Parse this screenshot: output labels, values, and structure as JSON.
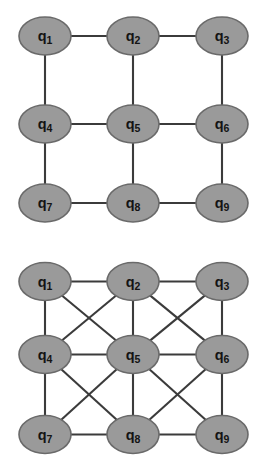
{
  "figure": {
    "background_color": "#ffffff",
    "node_fill_color": "#9a9a9a",
    "node_border_color": "#6a6a6a",
    "edge_color": "#3b3b3b",
    "label_color": "#141414"
  },
  "graphs": [
    {
      "id": "graph-top",
      "name": "nearest-neighbour-lattice",
      "description": "3x3 qubit grid with nearest-neighbour (orthogonal) couplings only",
      "rows": 3,
      "columns": 3,
      "nodes": [
        {
          "id": "q1",
          "symbol": "q",
          "subscript": "1",
          "label": "q1",
          "row": 0,
          "col": 0,
          "cx": 45,
          "cy": 36
        },
        {
          "id": "q2",
          "symbol": "q",
          "subscript": "2",
          "label": "q2",
          "row": 0,
          "col": 1,
          "cx": 133,
          "cy": 36
        },
        {
          "id": "q3",
          "symbol": "q",
          "subscript": "3",
          "label": "q3",
          "row": 0,
          "col": 2,
          "cx": 222,
          "cy": 36
        },
        {
          "id": "q4",
          "symbol": "q",
          "subscript": "4",
          "label": "q4",
          "row": 1,
          "col": 0,
          "cx": 45,
          "cy": 124
        },
        {
          "id": "q5",
          "symbol": "q",
          "subscript": "5",
          "label": "q5",
          "row": 1,
          "col": 1,
          "cx": 133,
          "cy": 124
        },
        {
          "id": "q6",
          "symbol": "q",
          "subscript": "6",
          "label": "q6",
          "row": 1,
          "col": 2,
          "cx": 222,
          "cy": 124
        },
        {
          "id": "q7",
          "symbol": "q",
          "subscript": "7",
          "label": "q7",
          "row": 2,
          "col": 0,
          "cx": 45,
          "cy": 203
        },
        {
          "id": "q8",
          "symbol": "q",
          "subscript": "8",
          "label": "q8",
          "row": 2,
          "col": 1,
          "cx": 133,
          "cy": 203
        },
        {
          "id": "q9",
          "symbol": "q",
          "subscript": "9",
          "label": "q9",
          "row": 2,
          "col": 2,
          "cx": 222,
          "cy": 203
        }
      ],
      "edges": [
        {
          "from": "q1",
          "to": "q2",
          "kind": "horizontal"
        },
        {
          "from": "q2",
          "to": "q3",
          "kind": "horizontal"
        },
        {
          "from": "q4",
          "to": "q5",
          "kind": "horizontal"
        },
        {
          "from": "q5",
          "to": "q6",
          "kind": "horizontal"
        },
        {
          "from": "q7",
          "to": "q8",
          "kind": "horizontal"
        },
        {
          "from": "q8",
          "to": "q9",
          "kind": "horizontal"
        },
        {
          "from": "q1",
          "to": "q4",
          "kind": "vertical"
        },
        {
          "from": "q2",
          "to": "q5",
          "kind": "vertical"
        },
        {
          "from": "q3",
          "to": "q6",
          "kind": "vertical"
        },
        {
          "from": "q4",
          "to": "q7",
          "kind": "vertical"
        },
        {
          "from": "q5",
          "to": "q8",
          "kind": "vertical"
        },
        {
          "from": "q6",
          "to": "q9",
          "kind": "vertical"
        }
      ]
    },
    {
      "id": "graph-bottom",
      "name": "king-graph-lattice",
      "description": "3x3 qubit grid with orthogonal plus diagonal couplings (king graph)",
      "rows": 3,
      "columns": 3,
      "nodes": [
        {
          "id": "q1",
          "symbol": "q",
          "subscript": "1",
          "label": "q1",
          "row": 0,
          "col": 0,
          "cx": 45,
          "cy": 36
        },
        {
          "id": "q2",
          "symbol": "q",
          "subscript": "2",
          "label": "q2",
          "row": 0,
          "col": 1,
          "cx": 133,
          "cy": 36
        },
        {
          "id": "q3",
          "symbol": "q",
          "subscript": "3",
          "label": "q3",
          "row": 0,
          "col": 2,
          "cx": 222,
          "cy": 36
        },
        {
          "id": "q4",
          "symbol": "q",
          "subscript": "4",
          "label": "q4",
          "row": 1,
          "col": 0,
          "cx": 45,
          "cy": 109
        },
        {
          "id": "q5",
          "symbol": "q",
          "subscript": "5",
          "label": "q5",
          "row": 1,
          "col": 1,
          "cx": 133,
          "cy": 109
        },
        {
          "id": "q6",
          "symbol": "q",
          "subscript": "6",
          "label": "q6",
          "row": 1,
          "col": 2,
          "cx": 222,
          "cy": 109
        },
        {
          "id": "q7",
          "symbol": "q",
          "subscript": "7",
          "label": "q7",
          "row": 2,
          "col": 0,
          "cx": 45,
          "cy": 189
        },
        {
          "id": "q8",
          "symbol": "q",
          "subscript": "8",
          "label": "q8",
          "row": 2,
          "col": 1,
          "cx": 133,
          "cy": 189
        },
        {
          "id": "q9",
          "symbol": "q",
          "subscript": "9",
          "label": "q9",
          "row": 2,
          "col": 2,
          "cx": 222,
          "cy": 189
        }
      ],
      "edges": [
        {
          "from": "q1",
          "to": "q2",
          "kind": "horizontal"
        },
        {
          "from": "q2",
          "to": "q3",
          "kind": "horizontal"
        },
        {
          "from": "q4",
          "to": "q5",
          "kind": "horizontal"
        },
        {
          "from": "q5",
          "to": "q6",
          "kind": "horizontal"
        },
        {
          "from": "q7",
          "to": "q8",
          "kind": "horizontal"
        },
        {
          "from": "q8",
          "to": "q9",
          "kind": "horizontal"
        },
        {
          "from": "q1",
          "to": "q4",
          "kind": "vertical"
        },
        {
          "from": "q2",
          "to": "q5",
          "kind": "vertical"
        },
        {
          "from": "q3",
          "to": "q6",
          "kind": "vertical"
        },
        {
          "from": "q4",
          "to": "q7",
          "kind": "vertical"
        },
        {
          "from": "q5",
          "to": "q8",
          "kind": "vertical"
        },
        {
          "from": "q6",
          "to": "q9",
          "kind": "vertical"
        },
        {
          "from": "q1",
          "to": "q5",
          "kind": "diagonal"
        },
        {
          "from": "q2",
          "to": "q4",
          "kind": "diagonal"
        },
        {
          "from": "q2",
          "to": "q6",
          "kind": "diagonal"
        },
        {
          "from": "q3",
          "to": "q5",
          "kind": "diagonal"
        },
        {
          "from": "q4",
          "to": "q8",
          "kind": "diagonal"
        },
        {
          "from": "q5",
          "to": "q7",
          "kind": "diagonal"
        },
        {
          "from": "q5",
          "to": "q9",
          "kind": "diagonal"
        },
        {
          "from": "q6",
          "to": "q8",
          "kind": "diagonal"
        }
      ]
    }
  ],
  "node_geometry": {
    "rx": 26,
    "ry": 19
  }
}
